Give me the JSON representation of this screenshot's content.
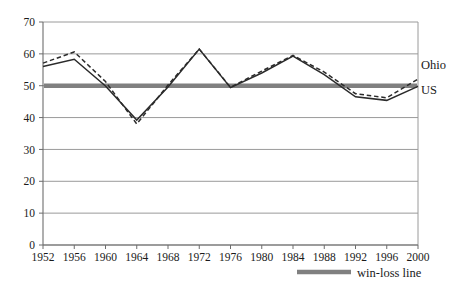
{
  "chart_data": {
    "type": "line",
    "title": "",
    "subtitle": "",
    "xlabel": "",
    "ylabel": "",
    "categories": [
      "1952",
      "1956",
      "1960",
      "1964",
      "1968",
      "1972",
      "1976",
      "1980",
      "1984",
      "1988",
      "1992",
      "1996",
      "2000"
    ],
    "x": [
      1952,
      1956,
      1960,
      1964,
      1968,
      1972,
      1976,
      1980,
      1984,
      1988,
      1992,
      1996,
      2000
    ],
    "series": [
      {
        "name": "US",
        "style": "solid",
        "color": "#2b2b2b",
        "values": [
          56.0,
          58.3,
          49.9,
          39.2,
          49.6,
          61.5,
          49.4,
          54.0,
          59.3,
          53.5,
          46.5,
          45.4,
          49.8
        ]
      },
      {
        "name": "Ohio",
        "style": "dashed",
        "color": "#2b2b2b",
        "values": [
          57.1,
          60.6,
          51.3,
          38.0,
          50.2,
          61.5,
          49.5,
          54.6,
          59.5,
          54.3,
          47.5,
          46.2,
          52.1
        ]
      }
    ],
    "reference_line": {
      "name": "win-loss line",
      "value": 50,
      "color": "#808080"
    },
    "ylim": [
      0,
      70
    ],
    "yticks": [
      0,
      10,
      20,
      30,
      40,
      50,
      60,
      70
    ],
    "ytick_labels": [
      "0",
      "10",
      "20",
      "30",
      "40",
      "50",
      "60",
      "70"
    ],
    "grid": true,
    "grid_color": "#9a9a9a",
    "legend_position": "bottom-right",
    "axis_color": "#9a9a9a"
  },
  "series_labels": {
    "ohio": "Ohio",
    "us": "US"
  },
  "legend": {
    "items": [
      {
        "label": "win-loss line",
        "marker": "thick-gray-line"
      }
    ]
  }
}
